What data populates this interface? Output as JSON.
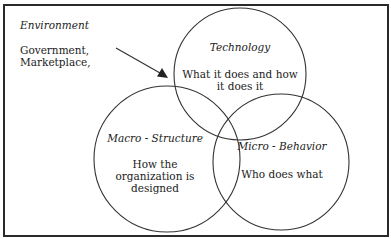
{
  "environment": {
    "title": "Environment",
    "lines": [
      "Government,",
      "Marketplace,"
    ]
  },
  "circles": {
    "technology": {
      "title": "Technology",
      "lines": [
        "What it does and how",
        "it does it"
      ]
    },
    "macro_structure": {
      "title": "Macro - Structure",
      "lines": [
        "How the",
        "organization is",
        "designed"
      ]
    },
    "micro_behavior": {
      "title": "Micro - Behavior",
      "lines": [
        "Who does what"
      ]
    }
  },
  "colors": {
    "line": "#333333",
    "background": "#ffffff"
  }
}
